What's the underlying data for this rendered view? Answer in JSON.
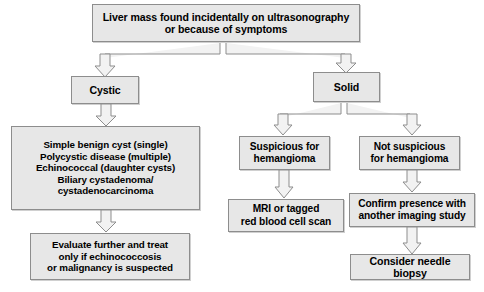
{
  "diagram": {
    "style": {
      "box_fill": "#e7e7e7",
      "box_border": "#8d8d8d",
      "text_color": "#000000",
      "background": "#ffffff",
      "arrow_fill": "#f2f2f2",
      "arrow_stroke": "#8d8d8d"
    },
    "nodes": [
      {
        "id": "root",
        "line1": "Liver mass found incidentally on ultrasonography",
        "line2": "or because of symptoms"
      },
      {
        "id": "cystic",
        "line1": "Cystic"
      },
      {
        "id": "solid",
        "line1": "Solid"
      },
      {
        "id": "cyst_types",
        "line1": "Simple benign cyst (single)",
        "line2": "Polycystic disease (multiple)",
        "line3": "Echinococcal (daughter cysts)",
        "line4": "Biliary cystadenoma/",
        "line5": "cystadenocarcinoma"
      },
      {
        "id": "evaluate",
        "line1": "Evaluate further and treat",
        "line2": "only if echinococcosis",
        "line3": "or malignancy is suspected"
      },
      {
        "id": "suspicious",
        "line1": "Suspicious for",
        "line2": "hemangioma"
      },
      {
        "id": "not_suspicious",
        "line1": "Not suspicious",
        "line2": "for hemangioma"
      },
      {
        "id": "mri",
        "line1": "MRI or tagged",
        "line2": "red blood cell scan"
      },
      {
        "id": "confirm",
        "line1": "Confirm presence with",
        "line2": "another imaging study"
      },
      {
        "id": "biopsy",
        "line1": "Consider needle biopsy"
      }
    ],
    "edges": [
      {
        "from": "root",
        "to": "cystic"
      },
      {
        "from": "root",
        "to": "solid"
      },
      {
        "from": "cystic",
        "to": "cyst_types"
      },
      {
        "from": "cyst_types",
        "to": "evaluate"
      },
      {
        "from": "solid",
        "to": "suspicious"
      },
      {
        "from": "solid",
        "to": "not_suspicious"
      },
      {
        "from": "suspicious",
        "to": "mri"
      },
      {
        "from": "not_suspicious",
        "to": "confirm"
      },
      {
        "from": "confirm",
        "to": "biopsy"
      }
    ]
  }
}
